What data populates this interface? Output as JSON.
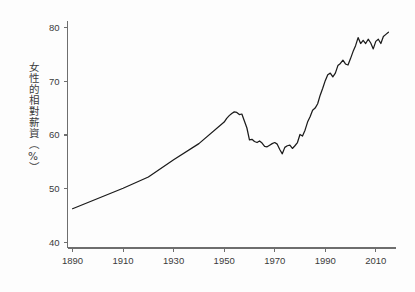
{
  "figure": {
    "background_color": "#fdfdfd",
    "line_color": "#1b1b1b",
    "axis_color": "#6e6e6e",
    "text_color": "#3b3b3b"
  },
  "axis": {
    "ylabel_text": "女性的相對薪資（%）"
  },
  "chart_data": {
    "type": "line",
    "title": "",
    "xlabel": "",
    "ylabel": "女性的相對薪資（%）",
    "xlim": [
      1888,
      2018
    ],
    "ylim": [
      39,
      81
    ],
    "grid": false,
    "legend": null,
    "xticks": [
      1890,
      1910,
      1930,
      1950,
      1970,
      1990,
      2010
    ],
    "xtick_labels": [
      "1890",
      "1910",
      "1930",
      "1950",
      "1970",
      "1990",
      "2010"
    ],
    "yticks": [
      40,
      50,
      60,
      70,
      80
    ],
    "ytick_labels": [
      "40",
      "50",
      "60",
      "70",
      "80"
    ],
    "series": [
      {
        "name": "女性的相對薪資",
        "x": [
          1890,
          1900,
          1910,
          1920,
          1930,
          1940,
          1950,
          1951,
          1952,
          1953,
          1954,
          1955,
          1956,
          1957,
          1958,
          1959,
          1960,
          1961,
          1962,
          1963,
          1964,
          1965,
          1966,
          1967,
          1968,
          1969,
          1970,
          1971,
          1972,
          1973,
          1974,
          1975,
          1976,
          1977,
          1978,
          1979,
          1980,
          1981,
          1982,
          1983,
          1984,
          1985,
          1986,
          1987,
          1988,
          1989,
          1990,
          1991,
          1992,
          1993,
          1994,
          1995,
          1996,
          1997,
          1998,
          1999,
          2000,
          2001,
          2002,
          2003,
          2004,
          2005,
          2006,
          2007,
          2008,
          2009,
          2010,
          2011,
          2012,
          2013,
          2014,
          2015
        ],
        "values": [
          46.3,
          48.2,
          50.1,
          52.2,
          55.4,
          58.4,
          62.4,
          63.1,
          63.6,
          64.0,
          64.3,
          64.2,
          63.8,
          63.9,
          62.6,
          61.3,
          59.1,
          59.2,
          58.8,
          58.6,
          58.9,
          58.5,
          57.9,
          57.8,
          58.1,
          58.4,
          58.6,
          58.3,
          57.3,
          56.5,
          57.7,
          58.0,
          58.1,
          57.5,
          58.0,
          58.6,
          60.1,
          59.8,
          60.9,
          62.4,
          63.4,
          64.6,
          65.0,
          65.8,
          67.4,
          68.7,
          70.1,
          71.2,
          71.5,
          70.8,
          71.5,
          72.9,
          73.3,
          73.9,
          73.2,
          73.0,
          74.2,
          75.5,
          76.6,
          78.1,
          77.0,
          77.6,
          77.0,
          77.8,
          77.1,
          76.0,
          77.4,
          77.8,
          77.0,
          78.3,
          78.7,
          79.1
        ]
      }
    ]
  }
}
